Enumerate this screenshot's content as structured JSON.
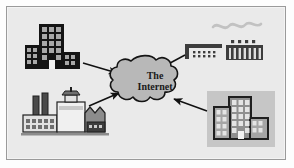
{
  "diagram": {
    "background_color": "#eaeaea",
    "frame_color": "#9a9a9a",
    "outer_color": "#ffffff",
    "center": {
      "shape": "cloud",
      "label_line1": "The",
      "label_line2": "Internet",
      "fill_color": "#bdbdbd",
      "outline_color": "#1a1a1a"
    },
    "nodes": [
      {
        "id": "office-building-dark",
        "label": "",
        "icon": "office-building-icon",
        "position": "top-left",
        "fill_color": "#1a1a1a",
        "accent_color": "#9e9e9e"
      },
      {
        "id": "factory",
        "label": "",
        "icon": "factory-icon",
        "position": "bottom-left",
        "fill_color": "#4a4a4a",
        "accent_color": "#c9c9c9"
      },
      {
        "id": "network-equipment",
        "label": "",
        "icon": "network-hub-icon",
        "position": "top-right",
        "fill_color": "#3d3d3d",
        "accent_color": "#dedede"
      },
      {
        "id": "office-building-gray",
        "label": "",
        "icon": "office-building-icon",
        "position": "bottom-right",
        "fill_color": "#8f8f8f",
        "accent_color": "#cfcfcf"
      }
    ],
    "connections": [
      {
        "from": "office-building-dark",
        "to": "center",
        "direction": "to-center"
      },
      {
        "from": "factory",
        "to": "center",
        "direction": "to-center"
      },
      {
        "from": "network-equipment",
        "to": "center",
        "direction": "to-center"
      },
      {
        "from": "office-building-gray",
        "to": "center",
        "direction": "to-center"
      }
    ],
    "decorations": [
      {
        "id": "squiggle",
        "icon": "wave-squiggle-icon",
        "color": "#c2c2c2",
        "position": "top-right"
      }
    ]
  }
}
